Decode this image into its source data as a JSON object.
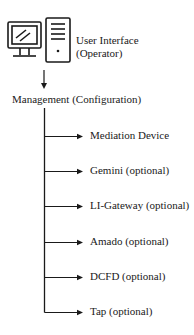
{
  "root": {
    "icon": "computer-workstation-icon",
    "label_line1": "User Interface",
    "label_line2": "(Operator)"
  },
  "management": {
    "label": "Management (Configuration)"
  },
  "children": [
    {
      "label": "Mediation Device",
      "y": 136
    },
    {
      "label": "Gemini (optional)",
      "y": 171
    },
    {
      "label": "LI-Gateway (optional)",
      "y": 206
    },
    {
      "label": "Amado (optional)",
      "y": 242
    },
    {
      "label": "DCFD (optional)",
      "y": 277
    },
    {
      "label": "Tap (optional)",
      "y": 312
    }
  ],
  "colors": {
    "line": "#1a1a1a",
    "background": "#ffffff"
  }
}
